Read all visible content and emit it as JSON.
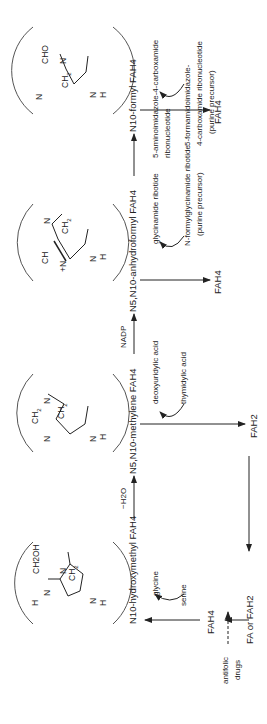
{
  "structures": [
    {
      "name": "N10-hydroxymethyl FAH4 core",
      "labels": [
        "CH2OH",
        "N",
        "10",
        "CH2",
        "9",
        "6",
        "7",
        "H",
        "N",
        "5",
        "H",
        "N",
        "8",
        "H",
        "H",
        "H"
      ]
    },
    {
      "name": "N5,N10-methylene FAH4 core",
      "labels": [
        "CH2",
        "N",
        "10",
        "CH2",
        "N",
        "5",
        "H",
        "H",
        "H",
        "N",
        "H"
      ]
    },
    {
      "name": "N5,N10-anhydroformyl FAH4 core",
      "labels": [
        "CH",
        "N",
        "10",
        "CH2",
        "+N",
        "5",
        "H",
        "H",
        "H",
        "N",
        "H"
      ]
    },
    {
      "name": "N10-formyl FAH4 core",
      "labels": [
        "CHO",
        "N",
        "10",
        "CH2",
        "H",
        "H",
        "H",
        "N",
        "5",
        "H",
        "N",
        "H"
      ]
    }
  ],
  "pathway": {
    "compounds": {
      "hydroxymethyl": "N10-hydroxymethyl FAH4",
      "methylene": "N5,N10-methylene FAH4",
      "anhydroformyl": "N5,N10-anhydroformyl FAH4",
      "formyl": "N10-formyl FAH4"
    },
    "arrow_labels": {
      "minus_water": "−H2O",
      "nadp": "NADP"
    },
    "side_reactions": {
      "serine_glycine": {
        "from": "serine",
        "to": "glycine"
      },
      "thymidylate": {
        "from": "deoxyuridylic acid",
        "to": "thymidylic acid"
      },
      "glycinamide": {
        "from": "glycinamide ribotide",
        "to": "N-formylglycinamide ribotide",
        "note": "(purine precursor)"
      },
      "aicar": {
        "from_line1": "5-aminoimidazole-4-carboxamide",
        "from_line2": "ribonucleotide",
        "to_line1": "5-formamidoimidazole-",
        "to_line2": "4-carboxamide ribonucleotide",
        "note": "(purine precursor)"
      }
    },
    "products": {
      "fah2": "FAH2",
      "fah4_a": "FAH4",
      "fah4_b": "FAH4"
    },
    "entry": {
      "source": "FA or FAH2",
      "intermediate": "FAH4",
      "inhibitor_line1": "antifolic",
      "inhibitor_line2": "drugs"
    }
  }
}
